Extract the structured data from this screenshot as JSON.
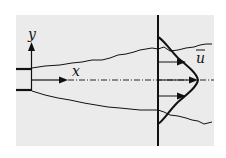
{
  "diagram": {
    "labels": {
      "y_axis": "y",
      "x_axis": "x",
      "mean_velocity": "u"
    },
    "colors": {
      "background_panel": "#ebebeb",
      "ink": "#111111"
    }
  }
}
